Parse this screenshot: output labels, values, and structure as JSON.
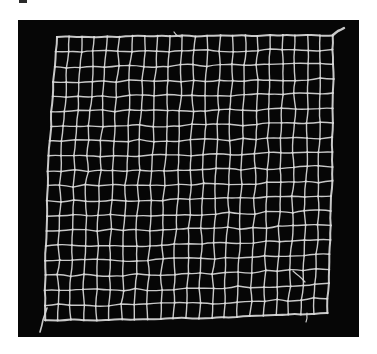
{
  "figure": {
    "alt_text": "Photograph of a square piece of knotted net laid flat on a black background",
    "mesh_columns": 22,
    "mesh_rows": 19,
    "colors": {
      "background": "#060606",
      "cord": "#d9d9d9",
      "page": "#ffffff"
    }
  }
}
